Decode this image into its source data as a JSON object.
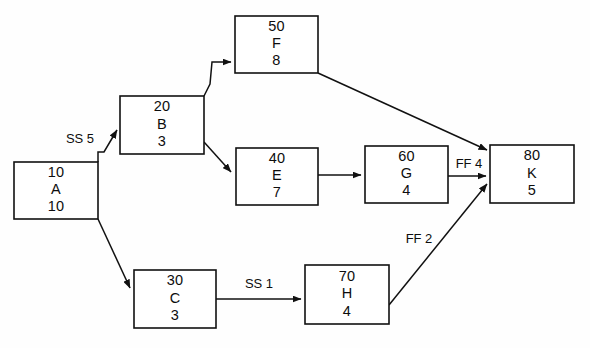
{
  "diagram": {
    "type": "activity-on-node-network",
    "colors": {
      "background": "#fefefe",
      "box_fill": "#ffffff",
      "stroke": "#111111",
      "text": "#0d0d0d"
    },
    "nodes": [
      {
        "key": "A",
        "id": "10",
        "name": "A",
        "duration": "10",
        "x": 14,
        "y": 162,
        "w": 84,
        "h": 57
      },
      {
        "key": "B",
        "id": "20",
        "name": "B",
        "duration": "3",
        "x": 120,
        "y": 96,
        "w": 84,
        "h": 58
      },
      {
        "key": "F",
        "id": "50",
        "name": "F",
        "duration": "8",
        "x": 235,
        "y": 16,
        "w": 83,
        "h": 57
      },
      {
        "key": "E",
        "id": "40",
        "name": "E",
        "duration": "7",
        "x": 236,
        "y": 148,
        "w": 82,
        "h": 57
      },
      {
        "key": "G",
        "id": "60",
        "name": "G",
        "duration": "4",
        "x": 365,
        "y": 146,
        "w": 83,
        "h": 57
      },
      {
        "key": "K",
        "id": "80",
        "name": "K",
        "duration": "5",
        "x": 490,
        "y": 145,
        "w": 84,
        "h": 58
      },
      {
        "key": "C",
        "id": "30",
        "name": "C",
        "duration": "3",
        "x": 134,
        "y": 270,
        "w": 82,
        "h": 58
      },
      {
        "key": "H",
        "id": "70",
        "name": "H",
        "duration": "4",
        "x": 305,
        "y": 265,
        "w": 84,
        "h": 59
      }
    ],
    "edges": [
      {
        "key": "A-B",
        "from": "A",
        "to": "B",
        "label": "SS 5",
        "label_x": 80,
        "label_y": 140,
        "path": "M 98 162 L 98 152 L 104 152 L 117 130"
      },
      {
        "key": "B-F",
        "from": "B",
        "to": "F",
        "label": "",
        "label_x": 0,
        "label_y": 0,
        "path": "M 204 96 L 210 84 L 212 62 L 231 62"
      },
      {
        "key": "B-E",
        "from": "B",
        "to": "E",
        "label": "",
        "label_x": 0,
        "label_y": 0,
        "path": "M 204 142 L 231 172"
      },
      {
        "key": "E-G",
        "from": "E",
        "to": "G",
        "label": "",
        "label_x": 0,
        "label_y": 0,
        "path": "M 318 175 L 361 175"
      },
      {
        "key": "G-K",
        "from": "G",
        "to": "K",
        "label": "FF 4",
        "label_x": 469,
        "label_y": 165,
        "path": "M 448 176 L 486 176"
      },
      {
        "key": "F-K",
        "from": "F",
        "to": "K",
        "label": "",
        "label_x": 0,
        "label_y": 0,
        "path": "M 318 73 L 487 150"
      },
      {
        "key": "A-C",
        "from": "A",
        "to": "C",
        "label": "",
        "label_x": 0,
        "label_y": 0,
        "path": "M 98 219 L 130 288"
      },
      {
        "key": "C-H",
        "from": "C",
        "to": "H",
        "label": "SS 1",
        "label_x": 259,
        "label_y": 285,
        "path": "M 216 299 L 301 299"
      },
      {
        "key": "H-K",
        "from": "H",
        "to": "K",
        "label": "FF 2",
        "label_x": 419,
        "label_y": 240,
        "path": "M 389 305 L 487 184"
      }
    ],
    "caption": ""
  }
}
